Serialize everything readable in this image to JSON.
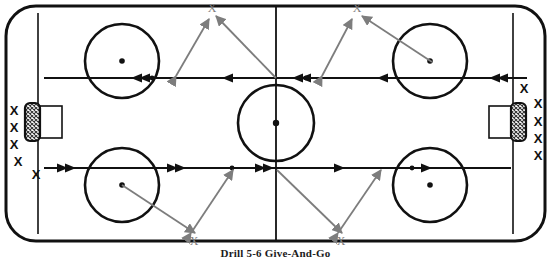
{
  "caption": {
    "text": "Drill 5-6  Give-And-Go"
  },
  "colors": {
    "rink_line": "#111111",
    "skate_path": "#111111",
    "pass_path": "#7d7d7d",
    "player_marker": "#111111",
    "target_marker": "#7d7d7d",
    "ice": "#ffffff",
    "crease_fill": "#4a4a4a"
  },
  "rink": {
    "label": "hockey-rink",
    "boards": {
      "x": 6,
      "y": 6,
      "width": 539,
      "height": 235,
      "corner_radius": 30
    },
    "goal_lines": [
      {
        "x": 38
      },
      {
        "x": 513
      }
    ],
    "center_line": {
      "x": 276
    },
    "center_circle": {
      "cx": 276,
      "cy": 123,
      "r": 38
    },
    "center_dot": {
      "cx": 276,
      "cy": 123,
      "r": 3
    },
    "faceoff_circles": [
      {
        "name": "top-left-faceoff-circle",
        "cx": 122,
        "cy": 61,
        "r": 37,
        "dot_cx": 122,
        "dot_cy": 61
      },
      {
        "name": "top-right-faceoff-circle",
        "cx": 430,
        "cy": 61,
        "r": 37,
        "dot_cx": 430,
        "dot_cy": 61
      },
      {
        "name": "bottom-left-faceoff-circle",
        "cx": 122,
        "cy": 185,
        "r": 37,
        "dot_cx": 122,
        "dot_cy": 185
      },
      {
        "name": "bottom-right-faceoff-circle",
        "cx": 430,
        "cy": 185,
        "r": 37,
        "dot_cx": 430,
        "dot_cy": 185
      }
    ],
    "nets": [
      {
        "name": "left-net",
        "crease_x": 26,
        "crease_y": 104,
        "crease_w": 14,
        "crease_h": 36,
        "cage_x": 40,
        "cage_y": 106,
        "cage_w": 22,
        "cage_h": 32
      },
      {
        "name": "right-net",
        "crease_x": 511,
        "crease_y": 104,
        "crease_w": 14,
        "crease_h": 36,
        "cage_x": 489,
        "cage_y": 106,
        "cage_w": 22,
        "cage_h": 32
      }
    ]
  },
  "lanes": {
    "top_lane_y": 78,
    "bottom_lane_y": 168
  },
  "players": {
    "left_queue": [
      {
        "name": "player-x-left-1",
        "x": 14,
        "y": 112,
        "label": "X"
      },
      {
        "name": "player-x-left-2",
        "x": 14,
        "y": 129,
        "label": "X"
      },
      {
        "name": "player-x-left-3",
        "x": 14,
        "y": 146,
        "label": "X"
      },
      {
        "name": "player-x-left-4",
        "x": 18,
        "y": 163,
        "label": "X"
      },
      {
        "name": "player-x-left-5",
        "x": 36,
        "y": 176,
        "label": "X"
      }
    ],
    "right_queue": [
      {
        "name": "player-x-right-1",
        "x": 524,
        "y": 90,
        "label": "X"
      },
      {
        "name": "player-x-right-2",
        "x": 537,
        "y": 105,
        "label": "X"
      },
      {
        "name": "player-x-right-3",
        "x": 537,
        "y": 123,
        "label": "X"
      },
      {
        "name": "player-x-right-4",
        "x": 537,
        "y": 140,
        "label": "X"
      },
      {
        "name": "player-x-right-5",
        "x": 537,
        "y": 157,
        "label": "X"
      }
    ],
    "targets": [
      {
        "name": "target-x-top-left",
        "x": 212,
        "y": 8,
        "label": "X"
      },
      {
        "name": "target-x-top-right",
        "x": 357,
        "y": 8,
        "label": "X"
      },
      {
        "name": "target-x-bottom-left",
        "x": 193,
        "y": 243,
        "label": "X"
      },
      {
        "name": "target-x-bottom-right",
        "x": 340,
        "y": 243,
        "label": "X"
      }
    ]
  },
  "paths": {
    "skate_top": {
      "name": "skate-lane-top-right-to-left",
      "description": "Players skate right-to-left along upper lane",
      "from_x": 525,
      "to_x": 44,
      "y": 78,
      "arrow_positions": [
        497,
        377,
        300,
        222,
        143,
        95
      ]
    },
    "skate_bottom": {
      "name": "skate-lane-bottom-left-to-right",
      "description": "Players skate left-to-right along lower lane",
      "from_x": 44,
      "to_x": 508,
      "y": 168,
      "arrow_positions": [
        62,
        172,
        232,
        268,
        330,
        403
      ]
    },
    "passes": [
      {
        "name": "pass-top-left-up",
        "x1": 174,
        "y1": 78,
        "x2": 210,
        "y2": 18,
        "double_headed": true
      },
      {
        "name": "pass-top-left-return",
        "x1": 214,
        "y1": 18,
        "x2": 277,
        "y2": 78,
        "double_headed": false
      },
      {
        "name": "pass-top-right-up",
        "x1": 322,
        "y1": 78,
        "x2": 353,
        "y2": 18,
        "double_headed": true
      },
      {
        "name": "pass-top-right-return",
        "x1": 358,
        "y1": 18,
        "x2": 432,
        "y2": 62,
        "double_headed": false
      },
      {
        "name": "pass-bottom-left-down",
        "x1": 122,
        "y1": 185,
        "x2": 196,
        "y2": 234,
        "double_headed": false
      },
      {
        "name": "pass-bottom-left-return",
        "x1": 190,
        "y1": 234,
        "x2": 232,
        "y2": 170,
        "double_headed": true
      },
      {
        "name": "pass-bottom-right-down",
        "x1": 277,
        "y1": 170,
        "x2": 343,
        "y2": 234,
        "double_headed": true
      },
      {
        "name": "pass-bottom-right-return",
        "x1": 340,
        "y1": 234,
        "x2": 382,
        "y2": 170,
        "double_headed": true
      }
    ]
  }
}
